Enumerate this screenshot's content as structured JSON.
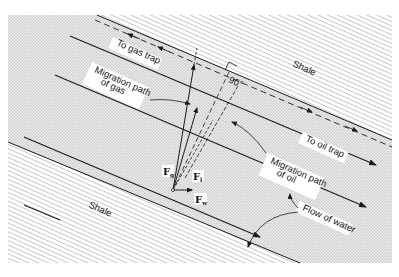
{
  "figure": {
    "type": "geologic cross-section diagram",
    "layers": {
      "upper": "Shale",
      "lower": "Shale"
    },
    "labels": {
      "to_gas_trap": "To gas trap",
      "migration_gas_line1": "Migration path",
      "migration_gas_line2": "of gas",
      "angle": "90°",
      "to_oil_trap": "To oil trap",
      "migration_oil_line1": "Migration path",
      "migration_oil_line2": "of oil",
      "flow_water": "Flow of water"
    },
    "vectors": {
      "gas": {
        "symbol": "F",
        "subscript": "g"
      },
      "oil": {
        "symbol": "F",
        "subscript": "l"
      },
      "water": {
        "symbol": "F",
        "subscript": "w"
      }
    },
    "colors": {
      "shale_hatch": "#8a8a8a",
      "sand_stipple": "#b5b5b5",
      "line": "#1a1a1a",
      "background": "#ffffff"
    }
  }
}
